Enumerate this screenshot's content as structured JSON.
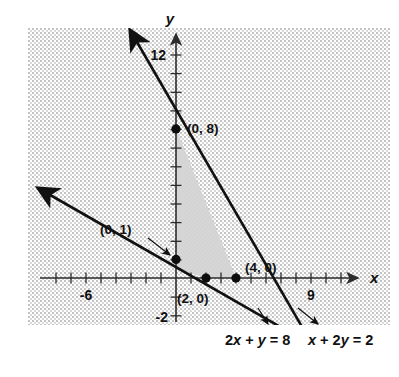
{
  "figure": {
    "title": "",
    "axes": {
      "x_axis_label": "x",
      "y_axis_label": "y",
      "x_ticks_labeled": [
        {
          "value": -6,
          "label": "-6"
        },
        {
          "value": 9,
          "label": "9"
        }
      ],
      "y_ticks_labeled": [
        {
          "value": 12,
          "label": "12"
        },
        {
          "value": -2,
          "label": "-2"
        }
      ],
      "xlim": [
        -9,
        13
      ],
      "ylim": [
        -3,
        13.5
      ],
      "x_tick_step": 1,
      "y_tick_step": 1
    },
    "lines": [
      {
        "name": "line-2x-plus-y-8",
        "equation_label": "2x + y = 8",
        "equation_parts": {
          "lead": "2",
          "var1": "x",
          "mid": " + ",
          "var2": "y",
          "eq": " = ",
          "rhs": "8"
        },
        "slope": -2,
        "intercept": 8,
        "x_intercept": 4,
        "y_intercept": 8
      },
      {
        "name": "line-x-plus-2y-2",
        "equation_label": "x + 2y = 2",
        "equation_parts": {
          "lead": "",
          "var1": "x",
          "mid": " + 2",
          "var2": "y",
          "eq": " = ",
          "rhs": "2"
        },
        "slope": -0.5,
        "intercept": 1,
        "x_intercept": 2,
        "y_intercept": 1
      }
    ],
    "points": [
      {
        "name": "point-0-8",
        "label": "(0, 8)",
        "x": 0,
        "y": 8
      },
      {
        "name": "point-0-1",
        "label": "(0, 1)",
        "x": 0,
        "y": 1
      },
      {
        "name": "point-2-0",
        "label": "(2, 0)",
        "x": 2,
        "y": 0
      },
      {
        "name": "point-4-0",
        "label": "(4, 0)",
        "x": 4,
        "y": 0
      }
    ],
    "shaded_region": {
      "name": "feasible-region",
      "description": "region bounded by both lines and the y-axis",
      "fill_color": "#d8d8d8"
    },
    "background": {
      "pattern": "stipple",
      "color": "#b9b9b9"
    }
  }
}
